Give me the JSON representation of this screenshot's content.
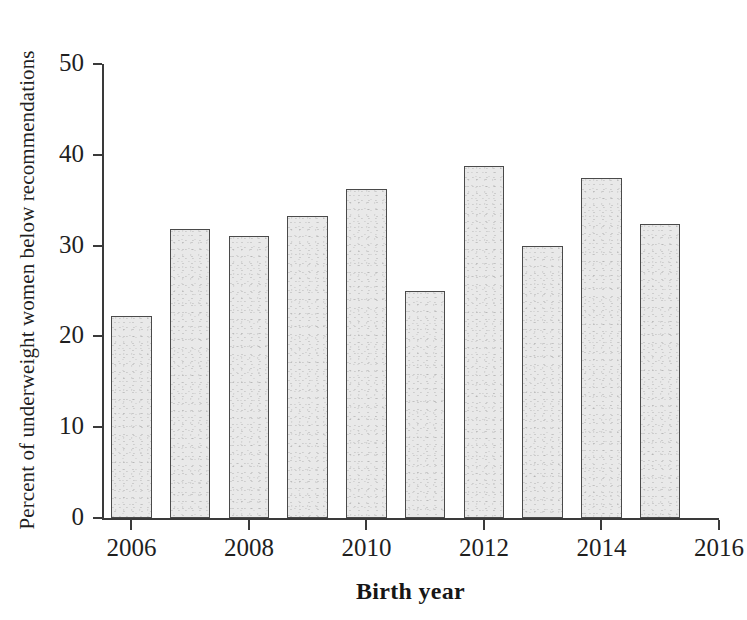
{
  "chart_data": {
    "type": "bar",
    "title": "",
    "subtitle": "",
    "xlabel": "Birth year",
    "ylabel": "Percent of underweight women below recommendations",
    "categories": [
      2006,
      2007,
      2008,
      2009,
      2010,
      2011,
      2012,
      2013,
      2014,
      2015
    ],
    "values": [
      22.2,
      31.8,
      31.1,
      33.3,
      36.2,
      25.0,
      38.8,
      30.0,
      37.5,
      32.4
    ],
    "series": [
      {
        "name": "Percent of underweight women below recommendations",
        "values": [
          22.2,
          31.8,
          31.1,
          33.3,
          36.2,
          25.0,
          38.8,
          30.0,
          37.5,
          32.4
        ]
      }
    ],
    "ylim": [
      0,
      50
    ],
    "xlim": [
      2005.5,
      2016
    ],
    "y_ticks": [
      0,
      10,
      20,
      30,
      40,
      50
    ],
    "y_tick_labels": [
      "0",
      "10",
      "20",
      "30",
      "40",
      "50"
    ],
    "x_ticks": [
      2006,
      2008,
      2010,
      2012,
      2014,
      2016
    ],
    "x_tick_labels": [
      "2006",
      "2008",
      "2010",
      "2012",
      "2014",
      "2016"
    ],
    "grid": false,
    "legend": false,
    "legend_position": "none",
    "bar_fill_color": "#e9e9e9",
    "bar_edge_color": "#4a4a4a",
    "axis_color": "#3a3a3a",
    "background_color": "#ffffff"
  }
}
